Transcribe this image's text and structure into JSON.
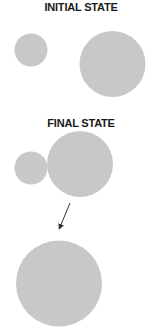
{
  "initial_state": {
    "title": "INITIAL STATE",
    "circles": [
      {
        "name": "small-circle",
        "cx": 31,
        "cy": 50,
        "r": 16.5
      },
      {
        "name": "large-circle",
        "cx": 112.5,
        "cy": 64,
        "r": 33
      }
    ]
  },
  "final_state": {
    "title": "FINAL STATE",
    "circles": [
      {
        "name": "small-circle",
        "cx": 31,
        "cy": 168,
        "r": 16.5
      },
      {
        "name": "large-circle",
        "cx": 80,
        "cy": 164,
        "r": 33
      }
    ],
    "merged_circle": {
      "name": "merged-circle",
      "cx": 59,
      "cy": 283.5,
      "r": 43
    }
  },
  "arrow": {
    "x1": 70,
    "y1": 203,
    "x2": 60,
    "y2": 227
  },
  "colors": {
    "circle_fill": "#c8c8c8",
    "text": "#1a1a1a",
    "arrow": "#333333"
  }
}
